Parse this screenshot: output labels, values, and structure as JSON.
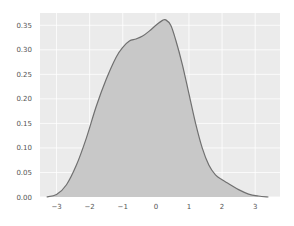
{
  "chart_data": {
    "type": "area",
    "kind": "kde",
    "title": "",
    "xlabel": "",
    "ylabel": "",
    "xlim": [
      -3.5,
      3.75
    ],
    "ylim": [
      0,
      0.375
    ],
    "grid": true,
    "legend": null,
    "xticks": [
      -3,
      -2,
      -1,
      0,
      1,
      2,
      3
    ],
    "yticks": [
      0.0,
      0.05,
      0.1,
      0.15,
      0.2,
      0.25,
      0.3,
      0.35
    ],
    "ytick_labels": [
      "0.00",
      "0.05",
      "0.10",
      "0.15",
      "0.20",
      "0.25",
      "0.30",
      "0.35"
    ],
    "series": [
      {
        "name": "density",
        "x": [
          -3.3,
          -3.0,
          -2.7,
          -2.4,
          -2.1,
          -1.8,
          -1.5,
          -1.2,
          -1.0,
          -0.8,
          -0.6,
          -0.4,
          -0.2,
          0.0,
          0.2,
          0.3,
          0.45,
          0.6,
          0.8,
          1.0,
          1.2,
          1.4,
          1.6,
          1.8,
          2.0,
          2.2,
          2.5,
          2.8,
          3.1,
          3.4
        ],
        "y": [
          0.0,
          0.005,
          0.025,
          0.065,
          0.12,
          0.185,
          0.24,
          0.285,
          0.305,
          0.318,
          0.322,
          0.328,
          0.338,
          0.35,
          0.36,
          0.361,
          0.35,
          0.32,
          0.27,
          0.21,
          0.15,
          0.1,
          0.065,
          0.045,
          0.035,
          0.027,
          0.015,
          0.006,
          0.002,
          0.0
        ]
      }
    ],
    "colors": {
      "background": "#ebebeb",
      "grid": "#ffffff",
      "fill": "#c8c8c8",
      "line": "#707070"
    }
  }
}
